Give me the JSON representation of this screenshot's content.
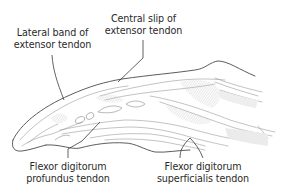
{
  "diagram": {
    "type": "anatomical-illustration",
    "labels": [
      {
        "id": "lateral-band",
        "line1": "Lateral band of",
        "line2": "extensor tendon",
        "x": 52,
        "y": 27
      },
      {
        "id": "central-slip",
        "line1": "Central slip of",
        "line2": "extensor tendon",
        "x": 141,
        "y": 13
      },
      {
        "id": "fdp",
        "line1": "Flexor digitorum",
        "line2": "profundus tendon",
        "x": 68,
        "y": 163
      },
      {
        "id": "fds",
        "line1": "Flexor digitorum",
        "line2": "superficialis tendon",
        "x": 203,
        "y": 163
      }
    ],
    "colors": {
      "outline": "#4a4a4a",
      "inner_line": "#9a9a9a",
      "shade": "#c9c9c9",
      "leader": "#3a3a3a",
      "text": "#2a2a2a"
    }
  }
}
